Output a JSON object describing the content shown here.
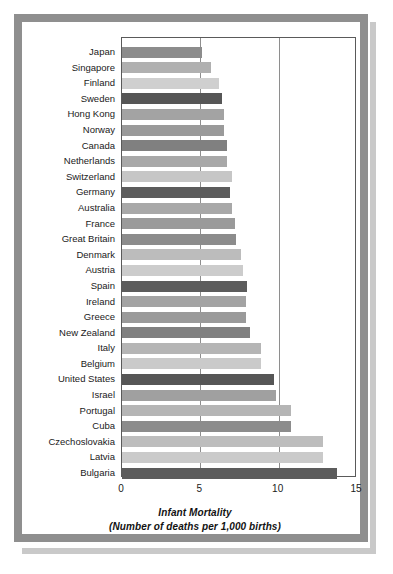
{
  "figure": {
    "frame_color": "#8f8f8f",
    "background": "#ffffff"
  },
  "caption": {
    "line1": "Infant Mortality",
    "line2": "(Number of deaths per 1,000 births)"
  },
  "axis": {
    "ticks": [
      "0",
      "5",
      "10",
      "15"
    ],
    "tick_values": [
      0,
      5,
      10,
      15
    ],
    "min": 0,
    "max": 15
  },
  "chart_data": {
    "type": "bar",
    "orientation": "horizontal",
    "title": "Infant Mortality",
    "xlabel": "Infant Mortality (Number of deaths per 1,000 births)",
    "ylabel": "",
    "xlim": [
      0,
      15
    ],
    "grid": true,
    "legend": "none",
    "categories": [
      "Japan",
      "Singapore",
      "Finland",
      "Sweden",
      "Hong Kong",
      "Norway",
      "Canada",
      "Netherlands",
      "Switzerland",
      "Germany",
      "Australia",
      "France",
      "Great Britain",
      "Denmark",
      "Austria",
      "Spain",
      "Ireland",
      "Greece",
      "New Zealand",
      "Italy",
      "Belgium",
      "United States",
      "Israel",
      "Portugal",
      "Cuba",
      "Czechoslovakia",
      "Latvia",
      "Bulgaria"
    ],
    "values": [
      5.1,
      5.7,
      6.2,
      6.4,
      6.5,
      6.5,
      6.7,
      6.7,
      7.0,
      6.9,
      7.0,
      7.2,
      7.3,
      7.6,
      7.7,
      8.0,
      7.9,
      7.9,
      8.2,
      8.9,
      8.9,
      9.7,
      9.8,
      10.8,
      10.8,
      12.8,
      12.8,
      13.7
    ],
    "bar_colors": [
      "#8c8c8c",
      "#b0b0b0",
      "#cfcfcf",
      "#565656",
      "#a3a3a3",
      "#9a9a9a",
      "#808080",
      "#a8a8a8",
      "#c6c6c6",
      "#5c5c5c",
      "#a8a8a8",
      "#9a9a9a",
      "#8c8c8c",
      "#bcbcbc",
      "#cccccc",
      "#5c5c5c",
      "#a3a3a3",
      "#9a9a9a",
      "#808080",
      "#b5b5b5",
      "#cacaca",
      "#565656",
      "#a0a0a0",
      "#b5b5b5",
      "#8c8c8c",
      "#bdbdbd",
      "#cacaca",
      "#5c5c5c"
    ]
  }
}
